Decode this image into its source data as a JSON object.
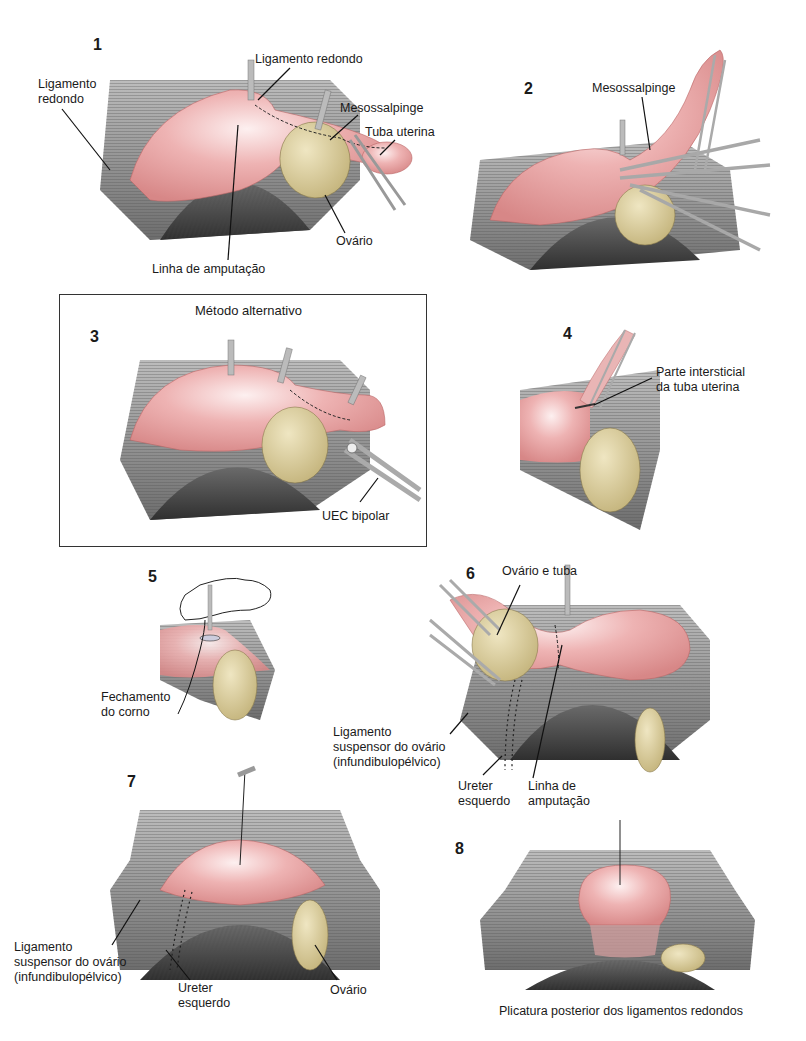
{
  "figure": {
    "panels": [
      {
        "number": "1",
        "labels": {
          "lig_redondo_left": "Ligamento\nredondo",
          "lig_redondo_top": "Ligamento redondo",
          "mesossalpinge": "Mesossalpinge",
          "tuba": "Tuba uterina",
          "ovario": "Ovário",
          "linha": "Linha de amputação"
        }
      },
      {
        "number": "2",
        "labels": {
          "mesossalpinge": "Mesossalpinge"
        }
      },
      {
        "number": "3",
        "title": "Método alternativo",
        "labels": {
          "uec": "UEC bipolar"
        }
      },
      {
        "number": "4",
        "labels": {
          "parte": "Parte intersticial\nda tuba uterina"
        }
      },
      {
        "number": "5",
        "labels": {
          "fechamento": "Fechamento\ndo corno"
        }
      },
      {
        "number": "6",
        "labels": {
          "ovario_tuba": "Ovário e tuba",
          "ligamento": "Ligamento\nsuspensor do ovário\n(infundibulopélvico)",
          "ureter": "Ureter\nesquerdo",
          "linha": "Linha de\namputação"
        }
      },
      {
        "number": "7",
        "labels": {
          "ligamento": "Ligamento\nsuspensor do ovário\n(infundibulopélvico)",
          "ureter": "Ureter\nesquerdo",
          "ovario": "Ovário"
        }
      },
      {
        "number": "8",
        "caption": "Plicatura posterior dos ligamentos redondos"
      }
    ],
    "colors": {
      "uterus": "#e8a3a3",
      "uterus_highlight": "#fbe3e3",
      "ovary": "#d9cc9a",
      "tissue": "#9a9a9a",
      "tissue_dark": "#5a5a5a",
      "instrument": "#c8c8c8"
    }
  }
}
